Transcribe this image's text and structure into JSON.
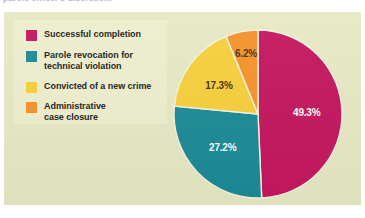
{
  "caption": {
    "text": "parole officer's discretion."
  },
  "colors": {
    "panel_background": "#e6e8c4",
    "legend_background": "#edeecd",
    "successful_completion": "#c4175e",
    "parole_revocation": "#1c8a96",
    "convicted_new_crime": "#f6cf3c",
    "administrative_closure": "#f5922b",
    "label_light": "#ffffff",
    "label_dark": "#4a3212",
    "slice_divider": "#f2f3e0"
  },
  "legend": {
    "items": [
      {
        "label": "Successful completion",
        "color_key": "successful_completion",
        "swatch_name": "legend-swatch-successful-completion"
      },
      {
        "label": "Parole revocation for\ntechnical violation",
        "color_key": "parole_revocation",
        "swatch_name": "legend-swatch-parole-revocation"
      },
      {
        "label": "Convicted of a new crime",
        "color_key": "convicted_new_crime",
        "swatch_name": "legend-swatch-convicted-new-crime"
      },
      {
        "label": "Administrative\ncase closure",
        "color_key": "administrative_closure",
        "swatch_name": "legend-swatch-administrative-closure"
      }
    ]
  },
  "chart_data": {
    "type": "pie",
    "title": "",
    "subtitle": "",
    "xlabel": "",
    "ylabel": "",
    "legend_position": "left",
    "grid": false,
    "start_angle_deg": 0,
    "direction": "clockwise",
    "categories": [
      "Successful completion",
      "Parole revocation for technical violation",
      "Convicted of a new crime",
      "Administrative case closure"
    ],
    "values": [
      49.3,
      27.2,
      17.3,
      6.2
    ],
    "unit": "percent",
    "data_labels": [
      "49.3%",
      "27.2%",
      "17.3%",
      "6.2%"
    ],
    "slice_colors": [
      "#c4175e",
      "#1c8a96",
      "#f6cf3c",
      "#f5922b"
    ],
    "label_text_colors": [
      "#ffffff",
      "#ffffff",
      "#4a3212",
      "#4a3212"
    ],
    "total": 100.0
  }
}
